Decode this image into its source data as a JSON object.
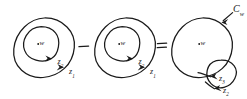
{
  "figure": {
    "kind": "hand-drawn-contour-diagram",
    "width": 247,
    "height": 99,
    "background_color": "#ffffff",
    "ink_color": "#1a1a1a",
    "caption": "",
    "panels": [
      {
        "id": "panel-left",
        "center_label": "w",
        "contours": [
          {
            "name": "outer",
            "label": "z",
            "subscript": "1",
            "orientation": "counterclockwise"
          },
          {
            "name": "inner",
            "label": "z",
            "subscript": "2",
            "orientation": "counterclockwise"
          }
        ]
      },
      {
        "id": "panel-middle",
        "center_label": "w",
        "contours": [
          {
            "name": "outer",
            "label": "z",
            "subscript": "1",
            "orientation": "counterclockwise"
          },
          {
            "name": "inner",
            "label": "z",
            "subscript": "2",
            "orientation": "counterclockwise"
          }
        ]
      },
      {
        "id": "panel-right",
        "center_label": "w",
        "pointer_label": "C",
        "pointer_subscript": "w",
        "contours": [
          {
            "name": "big",
            "label": "",
            "subscript": "",
            "orientation": "counterclockwise"
          },
          {
            "name": "small",
            "label": "z",
            "subscript": "3",
            "orientation": "clockwise"
          },
          {
            "name": "small-outer",
            "label": "z",
            "subscript": "2",
            "orientation": "clockwise"
          }
        ]
      }
    ],
    "operators": {
      "minus": "−",
      "equals": "="
    },
    "labels": {
      "w": "w",
      "z": "z",
      "C": "C",
      "sub_1": "1",
      "sub_2": "2",
      "sub_3": "3",
      "sub_w": "w"
    }
  }
}
